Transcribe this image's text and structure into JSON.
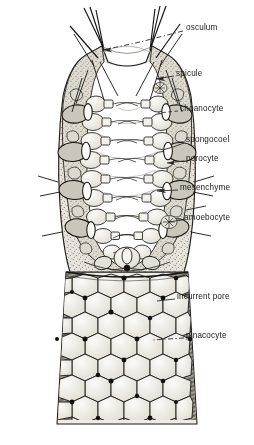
{
  "diagram": {
    "style": "ink-line-drawing",
    "colors": {
      "ink": "#1a1a1a",
      "paper": "#ffffff",
      "wall_fill": "#d9d6cf",
      "cell_fill": "#efece5",
      "shadow": "#4a4641",
      "leader": "#2a2a2a"
    }
  },
  "labels": [
    {
      "id": "osculum",
      "text": "osculum",
      "x": 186,
      "y": 28,
      "leader": "dashdot",
      "tip_x": 103,
      "tip_y": 50
    },
    {
      "id": "spicule",
      "text": "spicule",
      "x": 176,
      "y": 74,
      "leader": "arrow",
      "tip_x": 152,
      "tip_y": 78
    },
    {
      "id": "choanocyte",
      "text": "choanocyte",
      "x": 180,
      "y": 109,
      "leader": "dashed",
      "tip_x": 157,
      "tip_y": 113
    },
    {
      "id": "spongocoel",
      "text": "spongocoel",
      "x": 186,
      "y": 140,
      "leader": "plain",
      "tip_x": 160,
      "tip_y": 148
    },
    {
      "id": "porocyte",
      "text": "porocyte",
      "x": 186,
      "y": 159,
      "leader": "plain",
      "tip_x": 165,
      "tip_y": 163
    },
    {
      "id": "mesenchyme",
      "text": "mesenchyme",
      "x": 180,
      "y": 188,
      "leader": "arrow",
      "tip_x": 155,
      "tip_y": 191
    },
    {
      "id": "amoebocyte",
      "text": "amoebocyte",
      "x": 184,
      "y": 218,
      "leader": "plain",
      "tip_x": 162,
      "tip_y": 222
    },
    {
      "id": "incurrent-pore",
      "text": "incurrent pore",
      "x": 177,
      "y": 297,
      "leader": "plain",
      "tip_x": 155,
      "tip_y": 301
    },
    {
      "id": "pinacocyte",
      "text": "pinacocyte",
      "x": 186,
      "y": 336,
      "leader": "dashdot",
      "tip_x": 150,
      "tip_y": 340
    }
  ],
  "structures": {
    "osculum_note": "apical opening at top of sponge body, rimmed by projecting spicules",
    "spicule_note": "needle-like skeletal elements projecting from the body wall at the osculum",
    "choanocyte_note": "flagellated collar cells lining the spongocoel in two rows",
    "spongocoel_note": "central cavity of the asconoid sponge, shown cut away in the upper half",
    "porocyte_note": "tubular pore cells spanning the body wall",
    "mesenchyme_note": "stippled gelatinous layer between outer pinacoderm and inner choanoderm",
    "amoebocyte_note": "wandering cells embedded in the mesenchyme",
    "pinacocyte_note": "flat polygonal epidermal cells forming the outer mosaic on the lower half",
    "incurrent_pore_note": "dark openings between pinacocytes admitting water"
  }
}
